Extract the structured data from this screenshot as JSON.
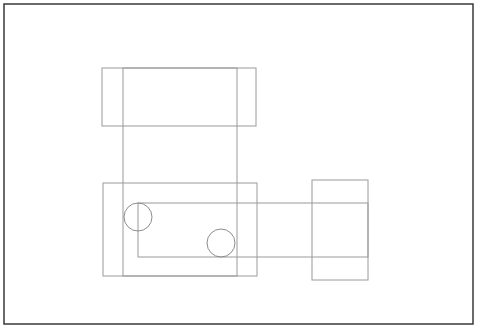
{
  "canvas": {
    "width": 484,
    "height": 334,
    "background_color": "#ffffff",
    "title": "Overlapping rectangles and circles line drawing"
  },
  "border_frame": {
    "name": "outer-frame",
    "x": 4,
    "y": 4,
    "width": 469,
    "height": 320,
    "stroke_color": "#2b2b2b",
    "stroke_width": 1.4,
    "fill": "none"
  },
  "shapes": [
    {
      "id": "top-wide-rectangle",
      "type": "rect",
      "x": 102,
      "y": 68,
      "width": 154,
      "height": 58,
      "stroke_color": "#9a9a9a",
      "stroke_width": 1,
      "fill": "none"
    },
    {
      "id": "tall-vertical-rectangle",
      "type": "rect",
      "x": 123,
      "y": 68,
      "width": 114,
      "height": 208,
      "stroke_color": "#9a9a9a",
      "stroke_width": 1,
      "fill": "none"
    },
    {
      "id": "main-lower-rectangle",
      "type": "rect",
      "x": 103,
      "y": 183,
      "width": 154,
      "height": 93,
      "stroke_color": "#9a9a9a",
      "stroke_width": 1,
      "fill": "none"
    },
    {
      "id": "wide-horizontal-band-rectangle",
      "type": "rect",
      "x": 138,
      "y": 203,
      "width": 230,
      "height": 54,
      "stroke_color": "#9a9a9a",
      "stroke_width": 1,
      "fill": "none"
    },
    {
      "id": "right-rectangle",
      "type": "rect",
      "x": 312,
      "y": 180,
      "width": 56,
      "height": 100,
      "stroke_color": "#9a9a9a",
      "stroke_width": 1,
      "fill": "none"
    },
    {
      "id": "circle-left",
      "type": "circle",
      "cx": 138,
      "cy": 217,
      "r": 14,
      "stroke_color": "#8c8c8c",
      "stroke_width": 1,
      "fill": "none"
    },
    {
      "id": "circle-right",
      "type": "circle",
      "cx": 221,
      "cy": 243,
      "r": 14,
      "stroke_color": "#8c8c8c",
      "stroke_width": 1,
      "fill": "none"
    }
  ],
  "legend": {
    "shape_count": 7,
    "rect_count": 5,
    "circle_count": 2
  }
}
